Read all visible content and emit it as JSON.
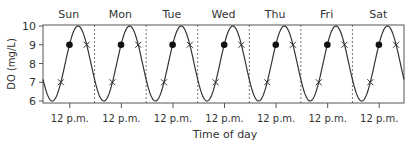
{
  "chart_data": {
    "type": "line",
    "title": "",
    "xlabel": "Time of day",
    "ylabel": "DO (mg/L)",
    "ylim": [
      6,
      10
    ],
    "yticks": [
      6,
      7,
      8,
      9,
      10
    ],
    "days": [
      "Sun",
      "Mon",
      "Tue",
      "Wed",
      "Thu",
      "Fri",
      "Sat"
    ],
    "xtick_label": "12 p.m.",
    "grid": false,
    "legend": null,
    "series": [
      {
        "name": "Dissolved oxygen",
        "description": "Daily sinusoidal cycle, min ~6 mg/L pre-dawn, max ~10 mg/L mid-afternoon",
        "min": 6,
        "max": 10,
        "period": "1 day"
      }
    ],
    "markers": {
      "dot": {
        "symbol": "filled-circle",
        "value": 9,
        "time": "12 p.m.",
        "count": 7
      },
      "cross_low": {
        "symbol": "x",
        "value": 7,
        "time": "morning",
        "count": 7
      },
      "cross_high": {
        "symbol": "x",
        "value": 9,
        "time": "afternoon",
        "count": 7
      }
    }
  },
  "colors": {
    "line": "#333333",
    "axis": "#555555",
    "divider": "#555555",
    "text": "#333333"
  }
}
